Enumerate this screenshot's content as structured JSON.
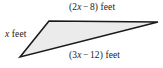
{
  "figure": {
    "name": "triangle-with-algebraic-side-labels",
    "shape_type": "triangle",
    "fill_color": "#ebebeb",
    "stroke_color": "#1a1a1a",
    "background_color": "#ffffff",
    "vertices": [
      {
        "name": "bottom-left-vertex",
        "x": 20,
        "y": 57
      },
      {
        "name": "top-left-vertex",
        "x": 49,
        "y": 21
      },
      {
        "name": "right-vertex",
        "x": 158,
        "y": 22
      }
    ],
    "labels": {
      "top": {
        "full_text": "(2x − 8) feet",
        "open_paren": "(",
        "coefficient": "2",
        "variable": "x",
        "operator": "−",
        "constant": "8",
        "close_paren": ")",
        "unit": "feet"
      },
      "left": {
        "full_text": "x feet",
        "variable": "x",
        "unit": "feet"
      },
      "bottom": {
        "full_text": "(3x − 12) feet",
        "open_paren": "(",
        "coefficient": "3",
        "variable": "x",
        "operator": "−",
        "constant": "12",
        "close_paren": ")",
        "unit": "feet"
      }
    }
  }
}
